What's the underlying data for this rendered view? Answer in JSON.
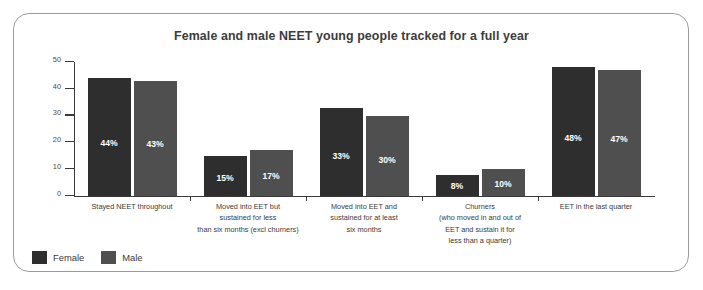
{
  "chart_data": {
    "type": "bar",
    "title": "Female and male NEET young people tracked for a full year",
    "xlabel": "",
    "ylabel": "",
    "ylim": [
      0,
      50
    ],
    "yticks": [
      0,
      10,
      20,
      30,
      40,
      50
    ],
    "grid": false,
    "legend_position": "bottom-left",
    "value_suffix": "%",
    "categories": [
      "Stayed NEET throughout",
      "Moved into EET but sustained for less than six months (excl churners)",
      "Moved into EET and sustained for at least six months",
      "Churners (who moved in and out of EET and sustain it for less than a quarter)",
      "EET in the last quarter"
    ],
    "category_lines": [
      [
        "Stayed NEET throughout"
      ],
      [
        "Moved into EET but",
        "sustained for less",
        "than six months (excl churners)"
      ],
      [
        "Moved into EET and",
        "sustained for at least",
        "six months"
      ],
      [
        "Churners",
        "(who moved in and out of",
        "EET and sustain it for",
        "less than a quarter)"
      ],
      [
        "EET in the last quarter"
      ]
    ],
    "series": [
      {
        "name": "Female",
        "color": "#2e2e2e",
        "values": [
          44,
          15,
          33,
          8,
          48
        ],
        "labels": [
          "44%",
          "15%",
          "33%",
          "8%",
          "48%"
        ]
      },
      {
        "name": "Male",
        "color": "#4f4f4f",
        "values": [
          43,
          17,
          30,
          10,
          47
        ],
        "labels": [
          "43%",
          "17%",
          "30%",
          "10%",
          "47%"
        ]
      }
    ]
  },
  "axis": {
    "y_tick_labels": [
      "50",
      "40",
      "30",
      "20",
      "10",
      "0"
    ]
  },
  "legend": {
    "items": [
      {
        "label": "Female",
        "color": "#2e2e2e"
      },
      {
        "label": "Male",
        "color": "#4f4f4f"
      }
    ]
  }
}
